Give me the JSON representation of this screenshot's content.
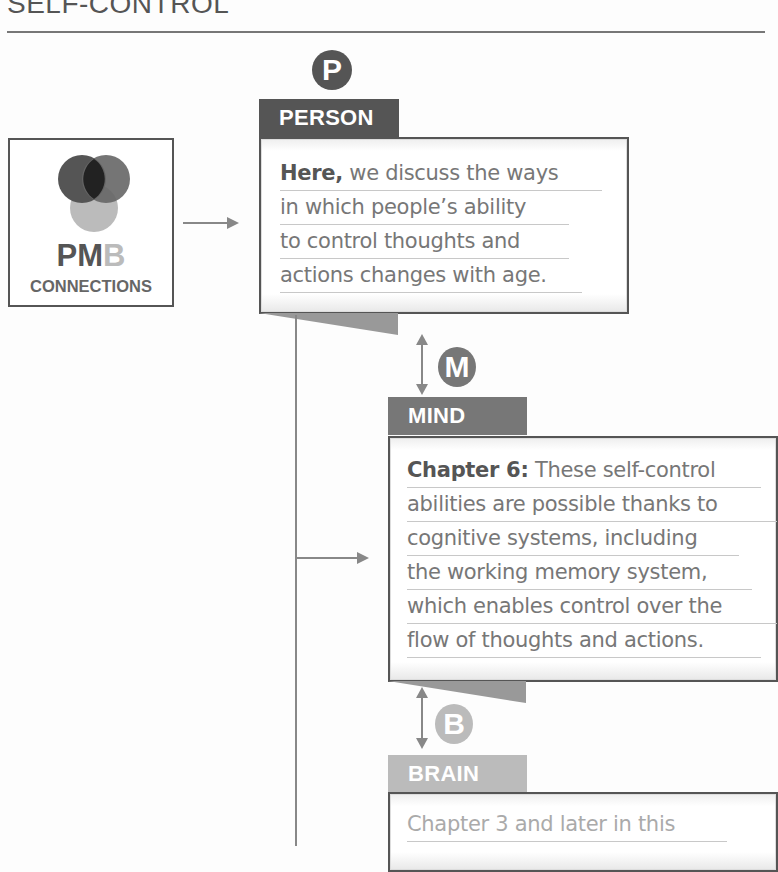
{
  "header": {
    "title": "SELF-CONTROL"
  },
  "pmb": {
    "letter_p": "P",
    "letter_m": "M",
    "letter_b": "B",
    "subtitle": "CONNECTIONS"
  },
  "person": {
    "badge": "P",
    "label": "PERSON",
    "lead": "Here,",
    "lines": [
      " we discuss the ways",
      "in which people’s ability",
      "to control thoughts and",
      "actions changes with age."
    ]
  },
  "mind": {
    "badge": "M",
    "label": "MIND",
    "lead": "Chapter 6:",
    "lines": [
      " These self-control",
      "abilities are possible thanks to",
      "cognitive systems, including",
      "the working memory system,",
      "which enables control over the",
      "flow of thoughts and actions."
    ]
  },
  "brain": {
    "badge": "B",
    "label": "BRAIN",
    "lines": [
      "Chapter 3 and later in this"
    ]
  },
  "colors": {
    "dark": "#555555",
    "mid": "#777777",
    "light": "#bbbbbb"
  }
}
